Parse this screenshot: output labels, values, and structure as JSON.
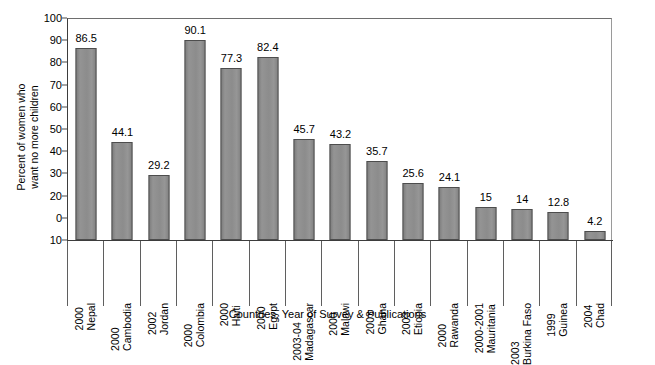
{
  "chart_data": {
    "type": "bar",
    "title": "",
    "xlabel": "Countries, Year of Survey & Publications",
    "ylabel": "Percent of women who want no more children",
    "ylabel_lines": [
      "Percent of women who",
      "want no more children"
    ],
    "ylim": [
      0,
      100
    ],
    "grid": false,
    "legend": "none",
    "bar_color": "#8d8d8d",
    "bar_edge_color": "#4d4d4d",
    "axis_color": "#3d3d3d",
    "ytick_labels": [
      "100",
      "90",
      "80",
      "70",
      "60",
      "50",
      "40",
      "30",
      "20",
      "0",
      "10"
    ],
    "ytick_values": [
      100,
      90,
      80,
      70,
      60,
      50,
      40,
      30,
      20,
      10,
      0
    ],
    "categories": [
      "2000 Nepal",
      "2000 Cambodia",
      "2002 Jordan",
      "2000 Colombia",
      "2000 Haiti",
      "2000 Egypt",
      "2003-04 Madagascar",
      "2000 Malawi",
      "2003 Ghana",
      "2003 Etiopia",
      "2000 Rawanda",
      "2000-2001 Mauritania",
      "2003 Burkina Faso",
      "1999 Guinea",
      "2004 Chad"
    ],
    "category_parts": [
      {
        "year": "2000",
        "country": "Nepal"
      },
      {
        "year": "2000",
        "country": "Cambodia"
      },
      {
        "year": "2002",
        "country": "Jordan"
      },
      {
        "year": "2000",
        "country": "Colombia"
      },
      {
        "year": "2000",
        "country": "Haiti"
      },
      {
        "year": "2000",
        "country": "Egypt"
      },
      {
        "year": "2003-04",
        "country": "Madagascar"
      },
      {
        "year": "2000",
        "country": "Malawi"
      },
      {
        "year": "2003",
        "country": "Ghana"
      },
      {
        "year": "2003",
        "country": "Etiopia"
      },
      {
        "year": "2000",
        "country": "Rawanda"
      },
      {
        "year": "2000-2001",
        "country": "Mauritania"
      },
      {
        "year": "2003",
        "country": "Burkina Faso"
      },
      {
        "year": "1999",
        "country": "Guinea"
      },
      {
        "year": "2004",
        "country": "Chad"
      }
    ],
    "values": [
      86.5,
      44.1,
      29.2,
      90.1,
      77.3,
      82.4,
      45.7,
      43.2,
      35.7,
      25.6,
      24.1,
      15,
      14,
      12.8,
      4.2
    ],
    "value_labels": [
      "86.5",
      "44.1",
      "29.2",
      "90.1",
      "77.3",
      "82.4",
      "45.7",
      "43.2",
      "35.7",
      "25.6",
      "24.1",
      "15",
      "14",
      "12.8",
      "4.2"
    ]
  }
}
